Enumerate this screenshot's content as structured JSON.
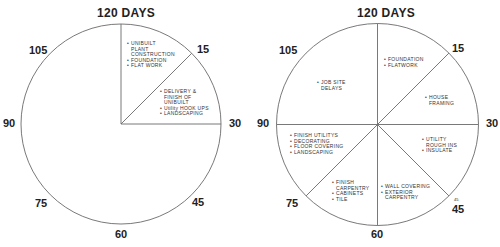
{
  "left_chart": {
    "title": "120 DAYS",
    "ticks": {
      "t0": "120 DAYS",
      "t15": "15",
      "t30": "30",
      "t45": "45",
      "t60": "60",
      "t75": "75",
      "t90": "90",
      "t105": "105"
    },
    "wedges": [
      {
        "range": "0-15",
        "items": [
          {
            "lines": [
              "UNIBUILT",
              "PLANT",
              "CONSTRUCTION"
            ]
          },
          {
            "lines": [
              "FOUNDATION"
            ]
          },
          {
            "lines": [
              "FLAT WORK"
            ]
          }
        ]
      },
      {
        "range": "15-30",
        "items": [
          {
            "lines": [
              "DELIVERY &",
              "FINISH OF",
              "UNIBUILT"
            ]
          },
          {
            "lines": [
              "Utility HOOK UPS"
            ]
          },
          {
            "lines": [
              "LANDSCAPING"
            ]
          }
        ]
      }
    ]
  },
  "right_chart": {
    "title": "120 DAYS",
    "ticks": {
      "t15": "15",
      "t30": "30",
      "t45": "45",
      "t45_small": "45",
      "t60": "60",
      "t75": "75",
      "t90": "90",
      "t105": "105"
    },
    "wedges": [
      {
        "range": "0-15",
        "items": [
          {
            "lines": [
              "FOUNDATION"
            ]
          },
          {
            "lines": [
              "FLATWORK"
            ]
          }
        ]
      },
      {
        "range": "15-30",
        "items": [
          {
            "lines": [
              "HOUSE",
              "FRAMING"
            ]
          }
        ]
      },
      {
        "range": "30-45",
        "items": [
          {
            "lines": [
              "UTILITY",
              "ROUGH INS"
            ]
          },
          {
            "lines": [
              "INSULATE"
            ]
          }
        ]
      },
      {
        "range": "45-60",
        "items": [
          {
            "lines": [
              "WALL COVERING"
            ]
          },
          {
            "lines": [
              "EXTERIOR",
              "CARPENTRY"
            ]
          }
        ]
      },
      {
        "range": "60-75",
        "items": [
          {
            "lines": [
              "FINISH",
              "CARPENTRY"
            ]
          },
          {
            "lines": [
              "CABINETS"
            ]
          },
          {
            "lines": [
              "TILE"
            ]
          }
        ]
      },
      {
        "range": "75-90",
        "items": [
          {
            "lines": [
              "FINISH UTILITYS"
            ]
          },
          {
            "lines": [
              "DECORATING"
            ]
          },
          {
            "lines": [
              "FLOOR COVERING"
            ]
          },
          {
            "lines": [
              "LANDSCAPING"
            ]
          }
        ]
      },
      {
        "range": "90-120",
        "items": [
          {
            "lines": [
              "JOB SITE",
              "DELAYS"
            ]
          }
        ]
      }
    ]
  },
  "bullet": "•",
  "colors": {
    "line": "#6a6a6a",
    "text": "#2a2a2a",
    "background": "#ffffff"
  }
}
